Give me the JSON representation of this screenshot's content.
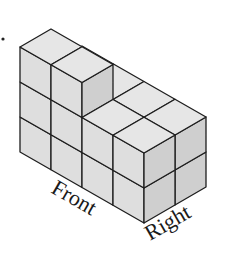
{
  "figure": {
    "labels": {
      "front": "Front",
      "right": "Right"
    },
    "marker": "•",
    "colors": {
      "top": "#e6e6e6",
      "front": "#dedede",
      "right": "#cfcfcf",
      "edge": "#1e1e1e",
      "label": "#1a1a1a"
    },
    "grid": {
      "columns": 4,
      "depth": 2,
      "heights": [
        [
          3,
          2
        ],
        [
          3,
          2
        ],
        [
          2,
          2
        ],
        [
          2,
          2
        ]
      ]
    }
  }
}
